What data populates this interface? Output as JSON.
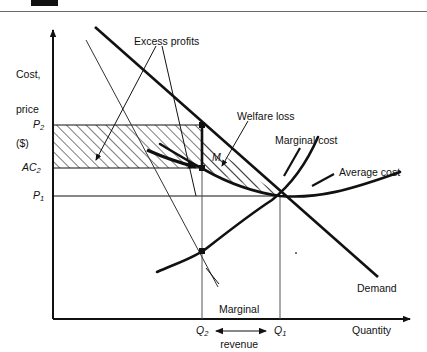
{
  "figure": {
    "domain": "economics-diagram",
    "topic": "Monopoly welfare loss and excess profits",
    "page_rule": true,
    "page_marker": "black-bar"
  },
  "axes": {
    "y_axis_label_lines": [
      "Cost,",
      "price",
      "($)"
    ],
    "x_axis_label": "Quantity",
    "origin": {
      "x": 53,
      "y": 319
    },
    "x_end": 417,
    "y_top": 24
  },
  "y_ticks": [
    {
      "id": "P2",
      "text": "P",
      "subscript": "2",
      "y": 125
    },
    {
      "id": "AC2",
      "text": "AC",
      "subscript": "2",
      "y": 168
    },
    {
      "id": "P1",
      "text": "P",
      "subscript": "1",
      "y": 196
    }
  ],
  "x_ticks": [
    {
      "id": "Q2",
      "text": "Q",
      "subscript": "2",
      "x": 202
    },
    {
      "id": "Q1",
      "text": "Q",
      "subscript": "1",
      "x": 280
    }
  ],
  "curve_labels": [
    {
      "id": "demand",
      "text": "Demand"
    },
    {
      "id": "marginal-revenue",
      "text": "Marginal\nrevenue"
    },
    {
      "id": "marginal-cost",
      "text": "Marginal cost"
    },
    {
      "id": "average-cost",
      "text": "Average cost"
    }
  ],
  "annotations": [
    {
      "id": "excess-profits",
      "text": "Excess profits"
    },
    {
      "id": "welfare-loss",
      "text": "Welfare loss"
    },
    {
      "id": "welfare-region",
      "text": "M"
    }
  ],
  "regions": [
    {
      "id": "excess-profits-box",
      "hatch": "diagonal-up-right",
      "bounds": {
        "x1": 53,
        "x2": 202,
        "y1": 125,
        "y2": 168
      }
    },
    {
      "id": "welfare-loss-triangle",
      "hatch": "diagonal-up-right",
      "vertex_left": {
        "x": 202,
        "y": 145
      },
      "vertex_right": {
        "x": 280,
        "y": 196
      }
    }
  ],
  "chart_data": {
    "type": "line",
    "title": "",
    "xlabel": "Quantity",
    "ylabel": "Cost, price ($)",
    "grid": false,
    "legend": "inline-callouts",
    "xlim": [
      0,
      417
    ],
    "ylim": [
      0,
      319
    ],
    "series": [
      {
        "name": "Demand",
        "points": [
          [
            95,
            27
          ],
          [
            378,
            277
          ]
        ]
      },
      {
        "name": "Marginal revenue",
        "points": [
          [
            86,
            40
          ],
          [
            218,
            287
          ]
        ]
      },
      {
        "name": "Marginal cost",
        "points": [
          [
            157,
            272
          ],
          [
            202,
            251
          ],
          [
            240,
            222
          ],
          [
            270,
            205
          ],
          [
            300,
            168
          ],
          [
            318,
            137
          ]
        ]
      },
      {
        "name": "Average cost",
        "points": [
          [
            160,
            145
          ],
          [
            185,
            158
          ],
          [
            202,
            168
          ],
          [
            240,
            186
          ],
          [
            280,
            196
          ],
          [
            330,
            192
          ],
          [
            372,
            179
          ],
          [
            400,
            172
          ]
        ]
      }
    ],
    "key_points": [
      {
        "name": "monopoly-price",
        "label": "P2",
        "value_y": 125
      },
      {
        "name": "monopoly-avgcost",
        "label": "AC2",
        "value_y": 168
      },
      {
        "name": "competitive-price",
        "label": "P1",
        "value_y": 196
      },
      {
        "name": "monopoly-quantity",
        "label": "Q2",
        "value_x": 202
      },
      {
        "name": "competitive-quantity",
        "label": "Q1",
        "value_x": 280
      }
    ]
  },
  "colors": {
    "ink": "#111111",
    "rule": "#6b6b6b",
    "thin_line": "#333333",
    "background": "#ffffff"
  }
}
